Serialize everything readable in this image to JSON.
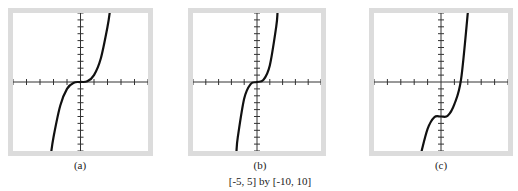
{
  "figure": {
    "caption": "[-5, 5] by [-10, 10]",
    "panels": [
      {
        "id": "a",
        "label": "(a)"
      },
      {
        "id": "b",
        "label": "(b)"
      },
      {
        "id": "c",
        "label": "(c)"
      }
    ]
  },
  "chart_data": [
    {
      "type": "line",
      "title": "(a)",
      "xlim": [
        -5,
        5
      ],
      "ylim": [
        -10,
        10
      ],
      "x_ticks": [
        -5,
        -4,
        -3,
        -2,
        -1,
        0,
        1,
        2,
        3,
        4,
        5
      ],
      "y_ticks": [
        -10,
        -9,
        -8,
        -7,
        -6,
        -5,
        -4,
        -3,
        -2,
        -1,
        0,
        1,
        2,
        3,
        4,
        5,
        6,
        7,
        8,
        9,
        10
      ],
      "grid": false,
      "description": "cubic through origin, y = x^3 shape",
      "x": [
        -2.2,
        -2,
        -1.5,
        -1,
        -0.5,
        0,
        0.5,
        1,
        1.5,
        2,
        2.2
      ],
      "y": [
        -10.6,
        -8,
        -3.4,
        -1,
        -0.1,
        0,
        0.1,
        1,
        3.4,
        8,
        10.6
      ]
    },
    {
      "type": "line",
      "title": "(b)",
      "xlim": [
        -5,
        5
      ],
      "ylim": [
        -10,
        10
      ],
      "x_ticks": [
        -5,
        -4,
        -3,
        -2,
        -1,
        0,
        1,
        2,
        3,
        4,
        5
      ],
      "y_ticks": [
        -10,
        -9,
        -8,
        -7,
        -6,
        -5,
        -4,
        -3,
        -2,
        -1,
        0,
        1,
        2,
        3,
        4,
        5,
        6,
        7,
        8,
        9,
        10
      ],
      "grid": false,
      "description": "cubic through origin, y = x^3 shape (same window)",
      "x": [
        -1.6,
        -1.5,
        -1,
        -0.5,
        0,
        0.5,
        1,
        1.5,
        1.6
      ],
      "y": [
        -10,
        -8,
        -2.4,
        -0.3,
        0,
        0.3,
        2.4,
        8,
        10
      ]
    },
    {
      "type": "line",
      "title": "(c)",
      "xlim": [
        -5,
        5
      ],
      "ylim": [
        -10,
        10
      ],
      "x_ticks": [
        -5,
        -4,
        -3,
        -2,
        -1,
        0,
        1,
        2,
        3,
        4,
        5
      ],
      "y_ticks": [
        -10,
        -9,
        -8,
        -7,
        -6,
        -5,
        -4,
        -3,
        -2,
        -1,
        0,
        1,
        2,
        3,
        4,
        5,
        6,
        7,
        8,
        9,
        10
      ],
      "grid": false,
      "description": "cubic shifted down ~5 with flat point near x=0, crossing x-axis near x=1.4",
      "x": [
        -1.5,
        -1,
        -0.5,
        0,
        0.5,
        1,
        1.5,
        2
      ],
      "y": [
        -10.4,
        -6.8,
        -5.1,
        -5,
        -4.9,
        -3.2,
        0.4,
        10
      ]
    }
  ]
}
